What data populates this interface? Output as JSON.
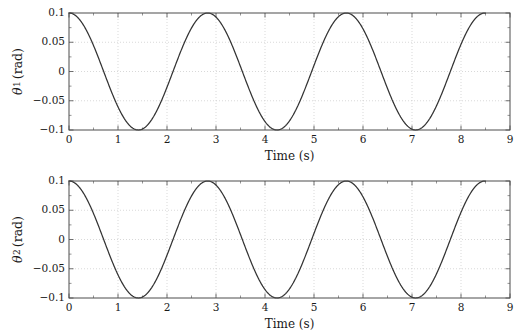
{
  "figure": {
    "background_color": "#ffffff",
    "axis_color": "#4d4d4d",
    "grid_color": "#c8c8c8",
    "curve_color": "#333333",
    "text_color": "#1a1a1a"
  },
  "chart_data": [
    {
      "type": "line",
      "panel_id": "theta1",
      "title": "",
      "xlabel": "Time (s)",
      "ylabel": "θ₁ (rad)",
      "ylabel_symbol": "θ",
      "ylabel_subscript": "1",
      "ylabel_units": "(rad)",
      "xlim": [
        0,
        9
      ],
      "ylim": [
        -0.1,
        0.1
      ],
      "xticks": [
        0,
        1,
        2,
        3,
        4,
        5,
        6,
        7,
        8,
        9
      ],
      "xtick_labels": [
        "0",
        "1",
        "2",
        "3",
        "4",
        "5",
        "6",
        "7",
        "8",
        "9"
      ],
      "yticks": [
        -0.1,
        -0.05,
        0,
        0.05,
        0.1
      ],
      "ytick_labels": [
        "-0.1",
        "-0.05",
        "0",
        "0.05",
        "0.1"
      ],
      "x_minor_tick_step": 0.5,
      "y_minor_tick_step": 0.025,
      "grid": true,
      "grid_style": "dotted",
      "legend": "none",
      "series": [
        {
          "name": "theta_1",
          "waveform": "cosine",
          "amplitude": 0.1,
          "period": 2.83,
          "phase_deg": 0,
          "offset": 0,
          "x_start": 0,
          "x_end": 8.5,
          "peaks_x": [
            0,
            2.83,
            5.66,
            8.49
          ],
          "troughs_x": [
            1.415,
            4.245,
            7.075
          ],
          "peak_value": 0.1,
          "trough_value": -0.1
        }
      ]
    },
    {
      "type": "line",
      "panel_id": "theta2",
      "title": "",
      "xlabel": "Time (s)",
      "ylabel": "θ₂ (rad)",
      "ylabel_symbol": "θ",
      "ylabel_subscript": "2",
      "ylabel_units": "(rad)",
      "xlim": [
        0,
        9
      ],
      "ylim": [
        -0.1,
        0.1
      ],
      "xticks": [
        0,
        1,
        2,
        3,
        4,
        5,
        6,
        7,
        8,
        9
      ],
      "xtick_labels": [
        "0",
        "1",
        "2",
        "3",
        "4",
        "5",
        "6",
        "7",
        "8",
        "9"
      ],
      "yticks": [
        -0.1,
        -0.05,
        0,
        0.05,
        0.1
      ],
      "ytick_labels": [
        "-0.1",
        "-0.05",
        "0",
        "0.05",
        "0.1"
      ],
      "x_minor_tick_step": 0.5,
      "y_minor_tick_step": 0.025,
      "grid": true,
      "grid_style": "dotted",
      "legend": "none",
      "series": [
        {
          "name": "theta_2",
          "waveform": "cosine",
          "amplitude": 0.1,
          "period": 2.83,
          "phase_deg": 0,
          "offset": 0,
          "x_start": 0,
          "x_end": 8.5,
          "peaks_x": [
            0,
            2.83,
            5.66,
            8.49
          ],
          "troughs_x": [
            1.415,
            4.245,
            7.075
          ],
          "peak_value": 0.1,
          "trough_value": -0.1
        }
      ]
    }
  ]
}
